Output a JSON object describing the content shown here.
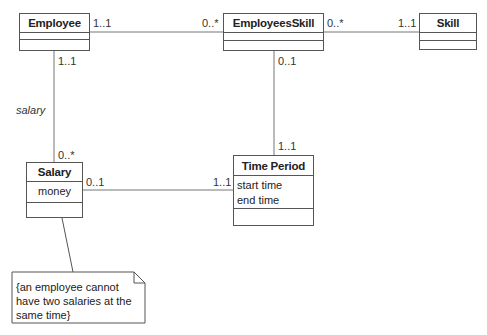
{
  "diagram": {
    "type": "UML class diagram",
    "classes": {
      "employee": {
        "name": "Employee",
        "attributes": []
      },
      "employees_skill": {
        "name": "EmployeesSkill",
        "attributes": []
      },
      "skill": {
        "name": "Skill",
        "attributes": []
      },
      "salary": {
        "name": "Salary",
        "attributes": [
          "money"
        ]
      },
      "time_period": {
        "name": "Time Period",
        "attributes": [
          "start time",
          "end time"
        ]
      }
    },
    "associations": [
      {
        "from": "Employee",
        "to": "EmployeesSkill",
        "from_mult": "1..1",
        "to_mult": "0..*"
      },
      {
        "from": "EmployeesSkill",
        "to": "Skill",
        "from_mult": "0..*",
        "to_mult": "1..1"
      },
      {
        "from": "EmployeesSkill",
        "to": "Time Period",
        "from_mult": "0..1",
        "to_mult": "1..1"
      },
      {
        "from": "Employee",
        "to": "Salary",
        "from_mult": "1..1",
        "to_mult": "0..*",
        "role": "salary"
      },
      {
        "from": "Salary",
        "to": "Time Period",
        "from_mult": "0..1",
        "to_mult": "1..1"
      }
    ],
    "note": {
      "attached_to": "Salary",
      "lines": [
        "{an employee cannot",
        "have two salaries at the",
        "same time}"
      ]
    }
  }
}
